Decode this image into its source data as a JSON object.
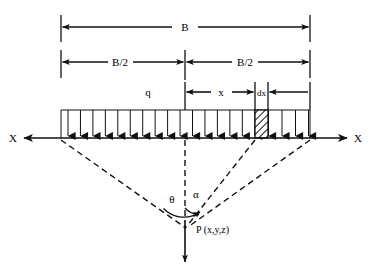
{
  "figure": {
    "labels": {
      "total_width": "B",
      "half_width_left": "B/2",
      "half_width_right": "B/2",
      "load_intensity": "q",
      "distance_x": "x",
      "element_width": "dx",
      "axis_left": "X",
      "axis_right": "X",
      "angle_theta": "θ",
      "angle_alpha": "α",
      "point": "P (x,y,z)"
    },
    "colors": {
      "line": "#111111",
      "background": "#ffffff",
      "hatch": "#111111"
    },
    "geometry": {
      "strip_left_x": 61,
      "strip_right_x": 310,
      "strip_center_x": 185,
      "ground_line_y": 138,
      "load_box_top_y": 110,
      "element_left_x": 255,
      "element_right_x": 268,
      "point_p_x": 185,
      "point_p_y": 227,
      "arrow_count": 20,
      "dim_line_b_y": 27,
      "dim_line_half_y": 62,
      "dim_line_x_y": 92
    }
  }
}
